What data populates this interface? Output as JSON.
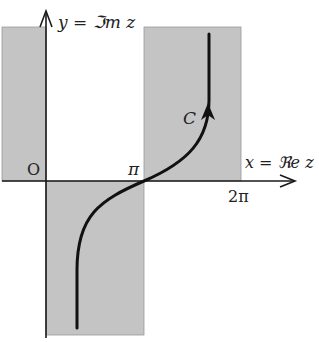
{
  "diagram": {
    "type": "complex-plane-contour",
    "colors": {
      "background": "#ffffff",
      "shade": "#c4c4c4",
      "axis": "#1a1a1a",
      "curve": "#111111"
    },
    "axes": {
      "y_label": "y = ℑm z",
      "x_label": "x = ℜe z"
    },
    "labels": {
      "origin": "O",
      "pi": "π",
      "two_pi": "2π",
      "contour": "C"
    },
    "regions": [
      {
        "name": "left-upper",
        "x_range": "(-∞,0)",
        "y": "upper"
      },
      {
        "name": "center-lower",
        "x_range": "(0,π)",
        "y": "lower"
      },
      {
        "name": "right-upper",
        "x_range": "(π,2π)",
        "y": "upper"
      }
    ]
  }
}
